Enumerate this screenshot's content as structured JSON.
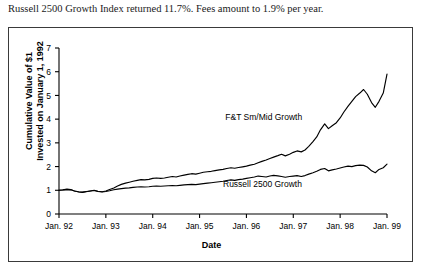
{
  "caption": "Russell 2500 Growth Index returned 11.7%. Fees amount to 1.9% per year.",
  "axis": {
    "ylabel_line1": "Cumulative Value of $1",
    "ylabel_line2": "Invested on January 1, 1992",
    "xlabel": "Date"
  },
  "series_labels": {
    "upper": "F&T Sm/Mid Growth",
    "lower": "Russell 2500 Growth"
  },
  "chart_data": {
    "type": "line",
    "title": "",
    "xlabel": "Date",
    "ylabel": "Cumulative Value of $1 Invested on January 1, 1992",
    "xlim": [
      1992.0,
      1999.0
    ],
    "ylim": [
      0,
      7
    ],
    "yticks": [
      0,
      1,
      2,
      3,
      4,
      5,
      6,
      7
    ],
    "xticks": [
      1992,
      1993,
      1994,
      1995,
      1996,
      1997,
      1998,
      1999
    ],
    "xticklabels": [
      "Jan. 92",
      "Jan. 93",
      "Jan. 94",
      "Jan. 95",
      "Jan. 96",
      "Jan. 97",
      "Jan. 98",
      "Jan. 99"
    ],
    "grid": false,
    "legend": "inline-annotations",
    "series": [
      {
        "name": "F&T Sm/Mid Growth",
        "color": "#000000",
        "x": [
          1992.0,
          1992.08,
          1992.17,
          1992.25,
          1992.33,
          1992.42,
          1992.5,
          1992.58,
          1992.67,
          1992.75,
          1992.83,
          1992.92,
          1993.0,
          1993.08,
          1993.17,
          1993.25,
          1993.33,
          1993.42,
          1993.5,
          1993.58,
          1993.67,
          1993.75,
          1993.83,
          1993.92,
          1994.0,
          1994.08,
          1994.17,
          1994.25,
          1994.33,
          1994.42,
          1994.5,
          1994.58,
          1994.67,
          1994.75,
          1994.83,
          1994.92,
          1995.0,
          1995.08,
          1995.17,
          1995.25,
          1995.33,
          1995.42,
          1995.5,
          1995.58,
          1995.67,
          1995.75,
          1995.83,
          1995.92,
          1996.0,
          1996.08,
          1996.17,
          1996.25,
          1996.33,
          1996.42,
          1996.5,
          1996.58,
          1996.67,
          1996.75,
          1996.83,
          1996.92,
          1997.0,
          1997.08,
          1997.17,
          1997.25,
          1997.33,
          1997.42,
          1997.5,
          1997.58,
          1997.67,
          1997.75,
          1997.83,
          1997.92,
          1998.0,
          1998.08,
          1998.17,
          1998.25,
          1998.33,
          1998.42,
          1998.5,
          1998.58,
          1998.67,
          1998.75,
          1998.83,
          1998.92,
          1999.0
        ],
        "y": [
          1.0,
          1.02,
          1.05,
          1.03,
          0.97,
          0.93,
          0.91,
          0.94,
          0.97,
          1.0,
          0.96,
          0.94,
          0.97,
          1.03,
          1.1,
          1.18,
          1.25,
          1.3,
          1.34,
          1.38,
          1.42,
          1.45,
          1.44,
          1.46,
          1.5,
          1.52,
          1.5,
          1.52,
          1.55,
          1.58,
          1.56,
          1.6,
          1.64,
          1.67,
          1.7,
          1.68,
          1.72,
          1.76,
          1.78,
          1.8,
          1.83,
          1.86,
          1.88,
          1.92,
          1.95,
          1.93,
          1.96,
          1.99,
          2.02,
          2.06,
          2.1,
          2.16,
          2.22,
          2.28,
          2.34,
          2.4,
          2.46,
          2.52,
          2.45,
          2.52,
          2.6,
          2.66,
          2.62,
          2.7,
          2.85,
          3.05,
          3.25,
          3.55,
          3.8,
          3.6,
          3.72,
          3.85,
          4.05,
          4.3,
          4.55,
          4.75,
          4.95,
          5.1,
          5.25,
          5.05,
          4.7,
          4.5,
          4.75,
          5.1,
          5.9
        ]
      },
      {
        "name": "Russell 2500 Growth",
        "color": "#000000",
        "x": [
          1992.0,
          1992.08,
          1992.17,
          1992.25,
          1992.33,
          1992.42,
          1992.5,
          1992.58,
          1992.67,
          1992.75,
          1992.83,
          1992.92,
          1993.0,
          1993.08,
          1993.17,
          1993.25,
          1993.33,
          1993.42,
          1993.5,
          1993.58,
          1993.67,
          1993.75,
          1993.83,
          1993.92,
          1994.0,
          1994.08,
          1994.17,
          1994.25,
          1994.33,
          1994.42,
          1994.5,
          1994.58,
          1994.67,
          1994.75,
          1994.83,
          1994.92,
          1995.0,
          1995.08,
          1995.17,
          1995.25,
          1995.33,
          1995.42,
          1995.5,
          1995.58,
          1995.67,
          1995.75,
          1995.83,
          1995.92,
          1996.0,
          1996.08,
          1996.17,
          1996.25,
          1996.33,
          1996.42,
          1996.5,
          1996.58,
          1996.67,
          1996.75,
          1996.83,
          1996.92,
          1997.0,
          1997.08,
          1997.17,
          1997.25,
          1997.33,
          1997.42,
          1997.5,
          1997.58,
          1997.67,
          1997.75,
          1997.83,
          1997.92,
          1998.0,
          1998.08,
          1998.17,
          1998.25,
          1998.33,
          1998.42,
          1998.5,
          1998.58,
          1998.67,
          1998.75,
          1998.83,
          1998.92,
          1999.0
        ],
        "y": [
          1.0,
          1.01,
          1.03,
          1.02,
          0.97,
          0.94,
          0.92,
          0.95,
          0.97,
          0.99,
          0.95,
          0.93,
          0.95,
          0.98,
          1.02,
          1.05,
          1.07,
          1.09,
          1.1,
          1.12,
          1.14,
          1.15,
          1.14,
          1.15,
          1.17,
          1.18,
          1.17,
          1.18,
          1.19,
          1.2,
          1.19,
          1.21,
          1.23,
          1.24,
          1.25,
          1.24,
          1.26,
          1.28,
          1.3,
          1.32,
          1.34,
          1.36,
          1.38,
          1.41,
          1.44,
          1.42,
          1.45,
          1.47,
          1.5,
          1.53,
          1.56,
          1.6,
          1.58,
          1.56,
          1.6,
          1.63,
          1.61,
          1.58,
          1.55,
          1.58,
          1.6,
          1.62,
          1.58,
          1.62,
          1.68,
          1.74,
          1.8,
          1.88,
          1.92,
          1.82,
          1.86,
          1.9,
          1.94,
          1.98,
          2.02,
          2.0,
          2.04,
          2.06,
          2.05,
          1.98,
          1.82,
          1.74,
          1.88,
          1.95,
          2.1
        ]
      }
    ]
  }
}
